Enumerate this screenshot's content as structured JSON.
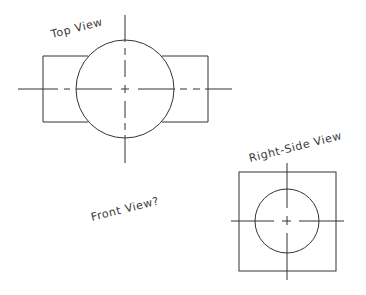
{
  "labels": {
    "top_view": "Top View",
    "right_side_view": "Right-Side View",
    "front_view": "Front View?"
  },
  "colors": {
    "background": "#ffffff",
    "line": "#333333",
    "text": "#3a3a3a"
  },
  "top_view": {
    "circle": {
      "cx": 125,
      "cy": 89,
      "r": 49
    },
    "rect": {
      "x1": 43,
      "y1": 56,
      "x2": 208,
      "y2": 122
    },
    "h_centerline": {
      "x1": 18,
      "x2": 232,
      "y": 89
    },
    "v_centerline": {
      "x": 125,
      "y1": 15,
      "y2": 163
    }
  },
  "right_side_view": {
    "circle": {
      "cx": 287,
      "cy": 221,
      "r": 32
    },
    "square": {
      "x1": 239,
      "y1": 172,
      "x2": 336,
      "y2": 271
    },
    "h_centerline": {
      "x1": 231,
      "x2": 344,
      "y": 221
    },
    "v_centerline": {
      "x": 287,
      "y1": 163,
      "y2": 280
    }
  }
}
